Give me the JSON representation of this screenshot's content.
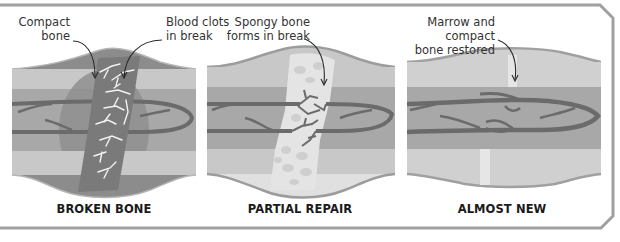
{
  "figure": {
    "colors": {
      "frame": "#9a9a9a",
      "compact_bone": "#c8c8c8",
      "marrow": "#a8a8a8",
      "vessel": "#6b6b6b",
      "clot": "#777777",
      "spongy_bone": "#e2e2e2",
      "periosteum": "#9c9c9c",
      "text": "#333333"
    }
  },
  "panels": [
    {
      "id": "broken",
      "label": "BROKEN BONE",
      "callouts": [
        {
          "text_line1": "Compact",
          "text_line2": "bone"
        },
        {
          "text_line1": "Blood clots",
          "text_line2": "in break"
        }
      ]
    },
    {
      "id": "partial",
      "label": "PARTIAL REPAIR",
      "callouts": [
        {
          "text_line1": "Spongy bone",
          "text_line2": "forms in break"
        }
      ]
    },
    {
      "id": "almost",
      "label": "ALMOST NEW",
      "callouts": [
        {
          "text_line1": "Marrow and compact",
          "text_line2": "bone restored"
        }
      ]
    }
  ]
}
